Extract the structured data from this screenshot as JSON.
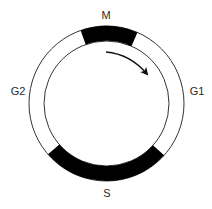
{
  "diagram": {
    "type": "cell-cycle",
    "center": [
      106.5,
      103.5
    ],
    "outer_radius": 77.5,
    "inner_radius": 62.5,
    "ring_color": "#ffffff",
    "band_color": "#000000",
    "line_color": "#333333",
    "phases": [
      {
        "id": "M",
        "label": "M",
        "filled": true,
        "start_deg": 250.5,
        "end_deg": 293.5
      },
      {
        "id": "G1",
        "label": "G1",
        "filled": false,
        "start_deg": 293.5,
        "end_deg": 402
      },
      {
        "id": "S",
        "label": "S",
        "filled": true,
        "start_deg": 42,
        "end_deg": 139
      },
      {
        "id": "G2",
        "label": "G2",
        "filled": false,
        "start_deg": 139,
        "end_deg": 250.5
      }
    ],
    "arrow": {
      "direction": "clockwise",
      "from": [
        106,
        52
      ],
      "to": [
        147,
        74
      ]
    },
    "labels": {
      "M": "M",
      "G1": "G1",
      "S": "S",
      "G2": "G2"
    }
  }
}
